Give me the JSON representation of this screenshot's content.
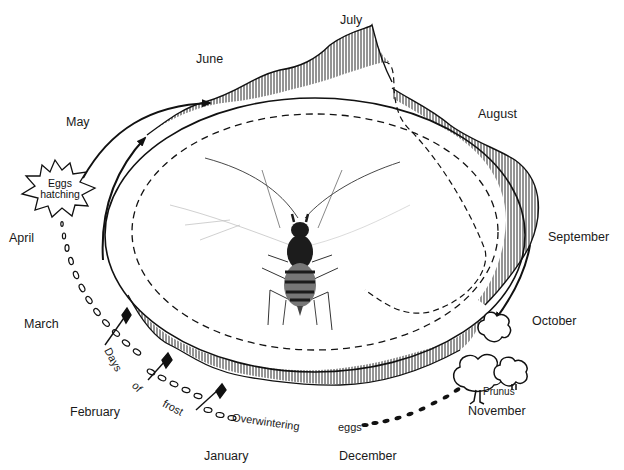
{
  "diagram": {
    "months": {
      "june": "June",
      "july": "July",
      "may": "May",
      "august": "August",
      "april": "April",
      "september": "September",
      "march": "March",
      "october": "October",
      "february": "February",
      "november": "November",
      "january": "January",
      "december": "December"
    },
    "callouts": {
      "eggs_hatching_line1": "Eggs",
      "eggs_hatching_line2": "hatching",
      "days": "Days",
      "of": "of",
      "frost": "frost",
      "overwintering": "Overwintering",
      "eggs": "eggs",
      "prunus": "Prunus"
    },
    "legend_elements": [
      "solid outer curve with vertical hatching (population above baseline)",
      "solid inner ellipse (baseline cycle)",
      "dashed inner ellipse (alternative cycle)",
      "dotted egg chain (overwintering eggs)",
      "diamond-headed arrows (frost events)",
      "trees (Prunus host)"
    ],
    "colors": {
      "ink": "#111111",
      "background": "#ffffff",
      "aphid_body": "#1c1c1c"
    }
  }
}
